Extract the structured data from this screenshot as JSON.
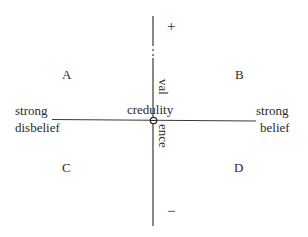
{
  "diagram": {
    "axes": {
      "horizontal": {
        "left_label_line1": "strong",
        "left_label_line2": "disbelief",
        "right_label_line1": "strong",
        "right_label_line2": "belief"
      },
      "vertical": {
        "label_top_part": "val",
        "label_bottom_part": "ence",
        "positive_sign": "+",
        "negative_sign": "−"
      },
      "origin_label": "credulity",
      "line_color": "#3a3a3a"
    },
    "quadrants": [
      {
        "id": "A",
        "label": "A"
      },
      {
        "id": "B",
        "label": "B"
      },
      {
        "id": "C",
        "label": "C"
      },
      {
        "id": "D",
        "label": "D"
      }
    ]
  }
}
